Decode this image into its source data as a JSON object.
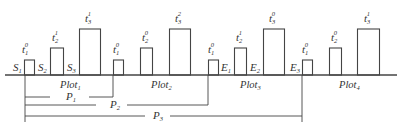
{
  "diagram": {
    "colors": {
      "stroke": "#444444",
      "text": "#333333",
      "background": "#ffffff"
    },
    "baseline_y": 75,
    "baseline": {
      "x1": 5,
      "x2": 397
    },
    "bar_heights": {
      "small": 15,
      "medium": 27,
      "tall": 46
    },
    "bars": [
      {
        "x": 24,
        "w": 10,
        "size": "small",
        "label": {
          "base": "t",
          "sub": "1",
          "sup": "0",
          "x": 22,
          "y": 53
        }
      },
      {
        "x": 50,
        "w": 13,
        "size": "medium",
        "label": {
          "base": "t",
          "sub": "2",
          "sup": "1",
          "x": 52,
          "y": 41
        }
      },
      {
        "x": 79,
        "w": 21,
        "size": "tall",
        "label": {
          "base": "t",
          "sub": "3",
          "sup": "1",
          "x": 85,
          "y": 22
        }
      },
      {
        "x": 113,
        "w": 10,
        "size": "small",
        "label": {
          "base": "t",
          "sub": "1",
          "sup": "0",
          "x": 113,
          "y": 53
        }
      },
      {
        "x": 140,
        "w": 12,
        "size": "medium",
        "label": {
          "base": "t",
          "sub": "2",
          "sup": "0",
          "x": 142,
          "y": 41
        }
      },
      {
        "x": 169,
        "w": 21,
        "size": "tall",
        "label": {
          "base": "t",
          "sub": "3",
          "sup": "2",
          "x": 175,
          "y": 22
        }
      },
      {
        "x": 208,
        "w": 10,
        "size": "small",
        "label": {
          "base": "t",
          "sub": "1",
          "sup": "0",
          "x": 208,
          "y": 53
        }
      },
      {
        "x": 234,
        "w": 12,
        "size": "medium",
        "label": {
          "base": "t",
          "sub": "2",
          "sup": "1",
          "x": 236,
          "y": 41
        }
      },
      {
        "x": 263,
        "w": 21,
        "size": "tall",
        "label": {
          "base": "t",
          "sub": "3",
          "sup": "0",
          "x": 269,
          "y": 22
        }
      },
      {
        "x": 302,
        "w": 10,
        "size": "small",
        "label": {
          "base": "t",
          "sub": "1",
          "sup": "0",
          "x": 302,
          "y": 53
        }
      },
      {
        "x": 329,
        "w": 12,
        "size": "medium",
        "label": {
          "base": "t",
          "sub": "2",
          "sup": "0",
          "x": 331,
          "y": 41
        }
      },
      {
        "x": 357,
        "w": 22,
        "size": "tall",
        "label": {
          "base": "t",
          "sub": "3",
          "sup": "1",
          "x": 364,
          "y": 22
        }
      }
    ],
    "state_labels": [
      {
        "base": "S",
        "sub": "1",
        "x": 13,
        "y": 71
      },
      {
        "base": "S",
        "sub": "2",
        "x": 38,
        "y": 71
      },
      {
        "base": "S",
        "sub": "3",
        "x": 67,
        "y": 71
      },
      {
        "base": "E",
        "sub": "1",
        "x": 221,
        "y": 71
      },
      {
        "base": "E",
        "sub": "2",
        "x": 250,
        "y": 71
      },
      {
        "base": "E",
        "sub": "3",
        "x": 290,
        "y": 71
      }
    ],
    "plot_labels": [
      {
        "base": "Plot",
        "sub": "1",
        "x": 60,
        "y": 88
      },
      {
        "base": "Plot",
        "sub": "2",
        "x": 151,
        "y": 88
      },
      {
        "base": "Plot",
        "sub": "3",
        "x": 240,
        "y": 88
      },
      {
        "base": "Plot",
        "sub": "4",
        "x": 339,
        "y": 88
      }
    ],
    "period_brackets": [
      {
        "name": "P",
        "sub": "1",
        "x1": 25,
        "x2": 113,
        "y": 97,
        "label_x": 66,
        "label_y": 100,
        "gap": [
          50,
          89
        ]
      },
      {
        "name": "P",
        "sub": "2",
        "x1": 25,
        "x2": 208,
        "y": 105,
        "label_x": 110,
        "label_y": 108,
        "gap": [
          96,
          127
        ]
      },
      {
        "name": "P",
        "sub": "3",
        "x1": 25,
        "x2": 302,
        "y": 116,
        "label_x": 153,
        "label_y": 119,
        "gap": [
          145,
          170
        ]
      }
    ],
    "left_tick": {
      "x": 25,
      "y1": 75,
      "y2": 122
    },
    "right_ticks": [
      {
        "x": 113,
        "y1": 75,
        "y2": 97
      },
      {
        "x": 208,
        "y1": 75,
        "y2": 105
      },
      {
        "x": 302,
        "y1": 75,
        "y2": 122
      }
    ]
  }
}
